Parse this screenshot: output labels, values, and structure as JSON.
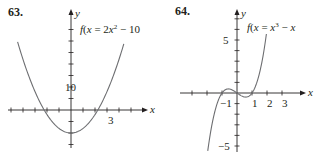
{
  "chart_data": [
    {
      "type": "line",
      "problem_number": "63.",
      "function_label": "f(x) = 2x² − 10",
      "function_label_parts": {
        "pre": "f(x) = 2x",
        "exp": "2",
        "post": " − 10"
      },
      "xlabel": "x",
      "ylabel": "y",
      "x_tick_labels": [
        {
          "value": 3,
          "label": "3"
        }
      ],
      "y_tick_labels": [
        {
          "value": 10,
          "label": "10"
        }
      ],
      "x_tick_step": 1,
      "y_tick_step": 5,
      "xlim": [
        -4.5,
        5
      ],
      "ylim": [
        -15,
        40
      ],
      "grid": false,
      "series": [
        {
          "name": "f(x) = 2x^2 - 10",
          "x": [
            -4.4,
            -4,
            -3,
            -2,
            -1,
            0,
            1,
            2,
            3,
            4,
            4.4
          ],
          "y": [
            28.72,
            22,
            8,
            -2,
            -8,
            -10,
            -8,
            -2,
            8,
            22,
            28.72
          ]
        }
      ],
      "color": "#231f20"
    },
    {
      "type": "line",
      "problem_number": "64.",
      "function_label": "f(x) = x³ − x",
      "function_label_parts": {
        "pre": "f(x) = x",
        "exp": "3",
        "post": " − x"
      },
      "xlabel": "x",
      "ylabel": "y",
      "x_tick_labels": [
        {
          "value": -1,
          "label": "−1"
        },
        {
          "value": 1,
          "label": "1"
        },
        {
          "value": 2,
          "label": "2"
        },
        {
          "value": 3,
          "label": "3"
        }
      ],
      "y_tick_labels": [
        {
          "value": 5,
          "label": "5"
        },
        {
          "value": -5,
          "label": "−5"
        }
      ],
      "x_tick_step": 1,
      "y_tick_step": 1,
      "xlim": [
        -3.8,
        4
      ],
      "ylim": [
        -5.5,
        7
      ],
      "grid": false,
      "series": [
        {
          "name": "f(x) = x^3 - x",
          "x": [
            -1.95,
            -1.5,
            -1,
            -0.577,
            0,
            0.577,
            1,
            1.5,
            1.95
          ],
          "y": [
            -5.46,
            -1.88,
            0,
            0.385,
            0,
            -0.385,
            0,
            1.88,
            5.46
          ]
        }
      ],
      "color": "#231f20"
    }
  ]
}
